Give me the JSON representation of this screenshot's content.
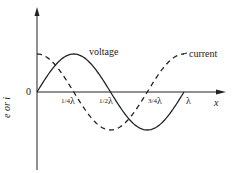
{
  "chart_data": {
    "type": "line",
    "title": "",
    "xlabel": "x",
    "ylabel": "e or i",
    "origin_label": "0",
    "x_ticks": [
      "1/4 λ",
      "1/2 λ",
      "3/4 λ",
      "λ"
    ],
    "series": [
      {
        "name": "voltage",
        "style": "solid",
        "function": "sin",
        "x": [
          0,
          0.25,
          0.5,
          0.75,
          1.0
        ],
        "values": [
          0,
          1,
          0,
          -1,
          0
        ]
      },
      {
        "name": "current",
        "style": "dashed",
        "function": "cos",
        "x": [
          0,
          0.25,
          0.5,
          0.75,
          1.0
        ],
        "values": [
          1,
          0,
          -1,
          0,
          1
        ]
      }
    ],
    "annotations": [
      "voltage",
      "current"
    ],
    "grid": false,
    "legend": "inline labels"
  },
  "labels": {
    "voltage": "voltage",
    "current": "current",
    "x_axis": "x",
    "y_axis": "e or i",
    "origin": "0",
    "tick_quarter_frac": "1/4",
    "tick_half_frac": "1/2",
    "tick_three_quarter_frac": "3/4",
    "lambda": "λ"
  }
}
